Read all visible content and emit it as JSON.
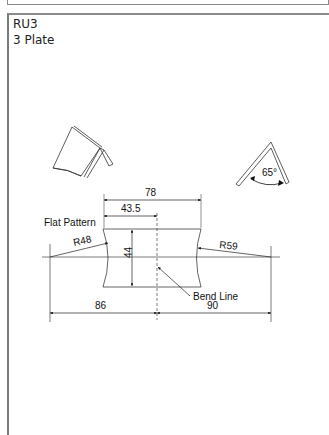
{
  "header": {
    "line1": "RU3",
    "line2": "3 Plate"
  },
  "drawing": {
    "flat_pattern_label": "Flat Pattern",
    "bend_line_label": "Bend Line",
    "dimensions": {
      "overall_width": "78",
      "half_width": "43.5",
      "height": "44",
      "left_radius": "R48",
      "right_radius": "R59",
      "left_center_offset": "86",
      "right_center_offset": "90",
      "bend_angle": "65°"
    },
    "views": [
      "isometric-view",
      "side-view-bend",
      "flat-pattern"
    ]
  },
  "colors": {
    "line": "#222222",
    "border": "#7a7a7a",
    "background": "#ffffff"
  }
}
